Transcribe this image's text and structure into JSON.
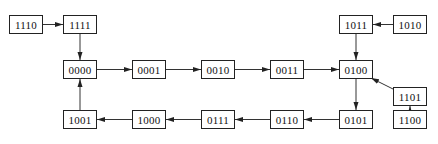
{
  "diagram": {
    "type": "state-transition",
    "nodes": [
      {
        "id": "1110",
        "label": "1110",
        "x": 9,
        "y": 15
      },
      {
        "id": "1111",
        "label": "1111",
        "x": 63,
        "y": 15
      },
      {
        "id": "1011",
        "label": "1011",
        "x": 339,
        "y": 15
      },
      {
        "id": "1010",
        "label": "1010",
        "x": 393,
        "y": 15
      },
      {
        "id": "0000",
        "label": "0000",
        "x": 63,
        "y": 60
      },
      {
        "id": "0001",
        "label": "0001",
        "x": 132,
        "y": 60
      },
      {
        "id": "0010",
        "label": "0010",
        "x": 201,
        "y": 60
      },
      {
        "id": "0011",
        "label": "0011",
        "x": 270,
        "y": 60
      },
      {
        "id": "0100",
        "label": "0100",
        "x": 339,
        "y": 60
      },
      {
        "id": "1101",
        "label": "1101",
        "x": 393,
        "y": 87
      },
      {
        "id": "1001",
        "label": "1001",
        "x": 63,
        "y": 110
      },
      {
        "id": "1000",
        "label": "1000",
        "x": 132,
        "y": 110
      },
      {
        "id": "0111",
        "label": "0111",
        "x": 201,
        "y": 110
      },
      {
        "id": "0110",
        "label": "0110",
        "x": 270,
        "y": 110
      },
      {
        "id": "0101",
        "label": "0101",
        "x": 339,
        "y": 110
      },
      {
        "id": "1100",
        "label": "1100",
        "x": 393,
        "y": 110
      }
    ],
    "edges": [
      {
        "from": "1110",
        "to": "1111"
      },
      {
        "from": "1111",
        "to": "0000"
      },
      {
        "from": "1010",
        "to": "1011"
      },
      {
        "from": "1011",
        "to": "0100"
      },
      {
        "from": "0000",
        "to": "0001"
      },
      {
        "from": "0001",
        "to": "0010"
      },
      {
        "from": "0010",
        "to": "0011"
      },
      {
        "from": "0011",
        "to": "0100"
      },
      {
        "from": "0100",
        "to": "0101"
      },
      {
        "from": "1101",
        "to": "0100"
      },
      {
        "from": "1100",
        "to": "1101"
      },
      {
        "from": "0101",
        "to": "0110"
      },
      {
        "from": "0110",
        "to": "0111"
      },
      {
        "from": "0111",
        "to": "1000"
      },
      {
        "from": "1000",
        "to": "1001"
      },
      {
        "from": "1001",
        "to": "0000"
      }
    ],
    "colors": {
      "stroke": "#222222",
      "text": "#111111",
      "background": "#ffffff"
    }
  }
}
